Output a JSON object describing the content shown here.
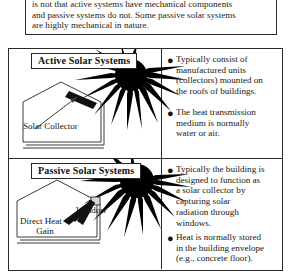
{
  "intro": {
    "paragraph": "is not that active systems have mechanical components\nand passive systems do not.  Some passive solar systems\nare highly mechanical in nature."
  },
  "diagram": {
    "active": {
      "title": "Active Solar Systems",
      "labels": {
        "collector": "Solar Collector"
      },
      "bullets": [
        "Typically consist of\nmanufactured units\n(collectors) mounted on\nthe roofs of buildings.",
        "The heat transmission\nmedium is normally\nwater or air."
      ]
    },
    "passive": {
      "title": "Passive Solar Systems",
      "labels": {
        "window": "Window",
        "direct_line1": "Direct Heat",
        "direct_line2": "Gain"
      },
      "bullets": [
        "Typically the building is\ndesigned to function as\na solar collector by\ncapturing solar\nradiation through\nwindows.",
        "Heat is normally stored\nin the building envelope\n(e.g., concrete floor)."
      ]
    }
  },
  "icons": {
    "bullet_glyph": "●",
    "sun_active": "sun-with-rays-icon",
    "sun_passive": "sun-with-rays-icon",
    "house_active": "house-with-collector-icon",
    "house_passive": "house-with-window-icon"
  },
  "colors": {
    "ink": "#1a1a1a",
    "border": "#2b2b2b",
    "paper": "#ffffff"
  }
}
